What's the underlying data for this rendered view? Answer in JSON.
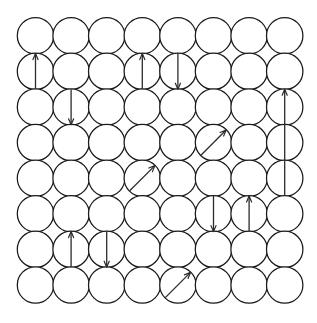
{
  "figure": {
    "background_color": "#ffffff",
    "circle_stroke_color": "#1a1a1a",
    "arrow_color": "#2b2b2b"
  },
  "lattice": {
    "rows": 8,
    "columns": 8,
    "circle_radius": 18.2,
    "pitch_x": 35.6,
    "pitch_y": 35.6,
    "origin_x": 35.5,
    "origin_y": 35.8
  },
  "arrows": [
    {
      "name": "arrow-r2c1-up",
      "row": 2,
      "col": 1,
      "direction": "up",
      "angle_deg": 90,
      "length_cells": 1.0
    },
    {
      "name": "arrow-r2c4-up",
      "row": 2,
      "col": 4,
      "direction": "up",
      "angle_deg": 90,
      "length_cells": 1.0
    },
    {
      "name": "arrow-r2c5-down",
      "row": 2,
      "col": 5,
      "direction": "down",
      "angle_deg": 270,
      "length_cells": 1.0
    },
    {
      "name": "arrow-r3c2-down",
      "row": 3,
      "col": 2,
      "direction": "down",
      "angle_deg": 270,
      "length_cells": 1.0
    },
    {
      "name": "arrow-r4c6-up-right",
      "row": 4,
      "col": 6,
      "direction": "up-right",
      "angle_deg": 45,
      "length_cells": 1.0
    },
    {
      "name": "arrow-r4c8-up-long",
      "row": 4,
      "col": 8,
      "direction": "up",
      "angle_deg": 90,
      "length_cells": 3.0
    },
    {
      "name": "arrow-r5c4-up-right",
      "row": 5,
      "col": 4,
      "direction": "up-right",
      "angle_deg": 45,
      "length_cells": 1.0
    },
    {
      "name": "arrow-r6c6-down",
      "row": 6,
      "col": 6,
      "direction": "down",
      "angle_deg": 270,
      "length_cells": 1.0
    },
    {
      "name": "arrow-r6c7-up",
      "row": 6,
      "col": 7,
      "direction": "up",
      "angle_deg": 90,
      "length_cells": 1.0
    },
    {
      "name": "arrow-r7c2-up",
      "row": 7,
      "col": 2,
      "direction": "up",
      "angle_deg": 90,
      "length_cells": 1.0
    },
    {
      "name": "arrow-r7c3-down",
      "row": 7,
      "col": 3,
      "direction": "down",
      "angle_deg": 270,
      "length_cells": 1.0
    },
    {
      "name": "arrow-r8c5-up-right",
      "row": 8,
      "col": 5,
      "direction": "up-right",
      "angle_deg": 45,
      "length_cells": 1.0
    }
  ]
}
